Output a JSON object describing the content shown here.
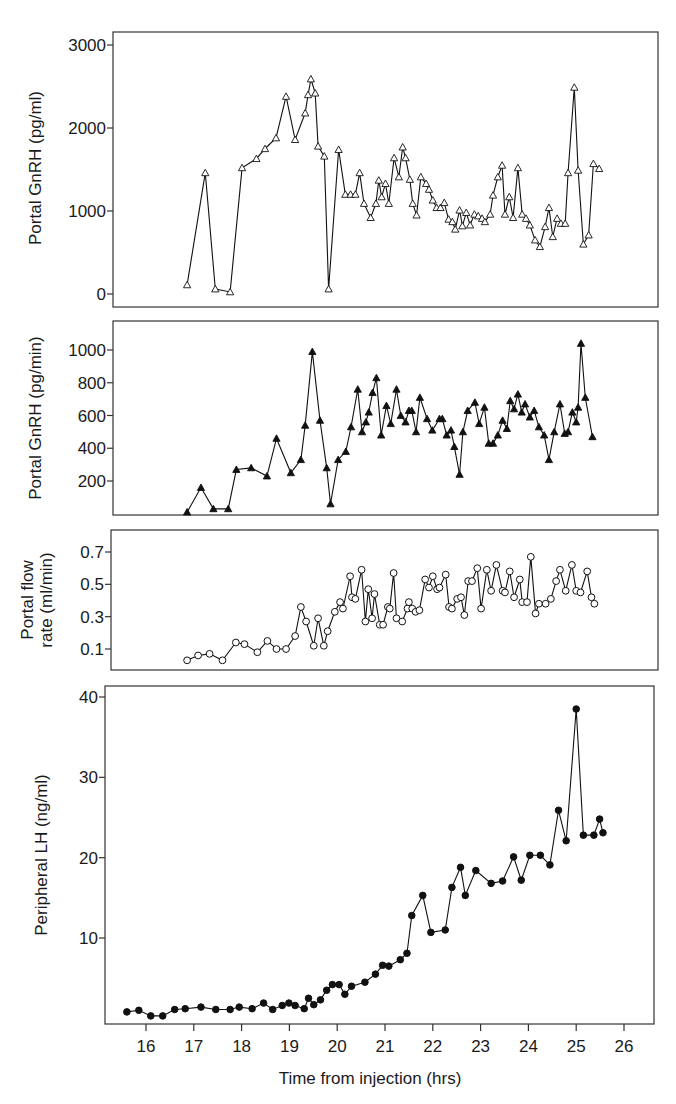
{
  "chart_data": [
    {
      "type": "line",
      "panel": 1,
      "ylabel": "Portal GnRH (pg/ml)",
      "xlabel": "",
      "marker": "open-triangle",
      "ylim": [
        -50,
        3160
      ],
      "yticks": [
        0,
        1000,
        2000,
        3000
      ],
      "ytick_labels": [
        "0",
        "1000",
        "2000",
        "3000"
      ],
      "grid": false,
      "x": [
        16.86,
        17.24,
        17.45,
        17.76,
        18.01,
        18.31,
        18.49,
        18.72,
        18.93,
        19.12,
        19.33,
        19.39,
        19.45,
        19.54,
        19.6,
        19.73,
        19.82,
        20.03,
        20.17,
        20.28,
        20.38,
        20.47,
        20.56,
        20.7,
        20.81,
        20.87,
        20.93,
        21.01,
        21.08,
        21.19,
        21.29,
        21.37,
        21.43,
        21.52,
        21.58,
        21.66,
        21.75,
        21.86,
        21.92,
        22.0,
        22.08,
        22.16,
        22.24,
        22.33,
        22.41,
        22.47,
        22.56,
        22.62,
        22.7,
        22.78,
        22.87,
        22.95,
        23.03,
        23.09,
        23.2,
        23.26,
        23.36,
        23.45,
        23.51,
        23.6,
        23.68,
        23.78,
        23.87,
        23.95,
        24.03,
        24.14,
        24.24,
        24.35,
        24.43,
        24.51,
        24.6,
        24.68,
        24.77,
        24.83,
        24.96,
        25.04,
        25.15,
        25.26,
        25.36,
        25.48
      ],
      "values": [
        110,
        1460,
        60,
        25,
        1520,
        1630,
        1750,
        1880,
        2380,
        1860,
        2180,
        2400,
        2590,
        2420,
        1780,
        1660,
        60,
        1740,
        1200,
        1200,
        1200,
        1460,
        1090,
        920,
        1090,
        1370,
        1170,
        1330,
        1090,
        1640,
        1410,
        1770,
        1640,
        1380,
        1090,
        950,
        1410,
        1330,
        1260,
        1130,
        1040,
        1040,
        1100,
        900,
        870,
        780,
        1010,
        820,
        980,
        830,
        960,
        940,
        910,
        870,
        960,
        1190,
        1410,
        1550,
        960,
        1170,
        920,
        1520,
        960,
        910,
        830,
        650,
        570,
        810,
        1040,
        690,
        910,
        850,
        850,
        1460,
        2490,
        1490,
        600,
        710,
        1570,
        1510
      ]
    },
    {
      "type": "line",
      "panel": 2,
      "ylabel": "Portal GnRH (pg/min)",
      "xlabel": "",
      "marker": "filled-triangle",
      "ylim": [
        0,
        1140
      ],
      "yticks": [
        200,
        400,
        600,
        800,
        1000
      ],
      "ytick_labels": [
        "200",
        "400",
        "600",
        "800",
        "1000"
      ],
      "grid": false,
      "x": [
        16.86,
        17.15,
        17.41,
        17.72,
        17.89,
        18.2,
        18.53,
        18.73,
        19.03,
        19.24,
        19.33,
        19.48,
        19.64,
        19.78,
        19.86,
        20.02,
        20.18,
        20.29,
        20.43,
        20.52,
        20.6,
        20.66,
        20.74,
        20.82,
        20.92,
        21.03,
        21.12,
        21.24,
        21.33,
        21.43,
        21.5,
        21.56,
        21.65,
        21.73,
        21.88,
        21.99,
        22.14,
        22.2,
        22.29,
        22.38,
        22.45,
        22.56,
        22.63,
        22.73,
        22.88,
        22.97,
        23.08,
        23.17,
        23.26,
        23.36,
        23.46,
        23.55,
        23.62,
        23.7,
        23.78,
        23.86,
        23.93,
        24.03,
        24.12,
        24.22,
        24.33,
        24.43,
        24.54,
        24.66,
        24.76,
        24.83,
        24.92,
        25.0,
        25.04,
        25.1,
        25.19,
        25.34
      ],
      "values": [
        10,
        160,
        30,
        30,
        270,
        280,
        230,
        460,
        250,
        330,
        540,
        990,
        570,
        280,
        60,
        330,
        380,
        530,
        760,
        500,
        560,
        620,
        740,
        830,
        480,
        660,
        550,
        760,
        600,
        560,
        630,
        630,
        500,
        710,
        580,
        510,
        580,
        580,
        480,
        510,
        410,
        240,
        500,
        630,
        680,
        550,
        650,
        430,
        430,
        480,
        570,
        520,
        690,
        640,
        730,
        620,
        670,
        590,
        630,
        530,
        480,
        330,
        500,
        670,
        490,
        500,
        620,
        560,
        650,
        1040,
        710,
        470,
        650
      ]
    },
    {
      "type": "line",
      "panel": 3,
      "ylabel": "Portal flow rate (ml/min)",
      "xlabel": "",
      "marker": "open-circle",
      "ylim": [
        -0.03,
        0.84
      ],
      "yticks": [
        0.1,
        0.3,
        0.5,
        0.7
      ],
      "ytick_labels": [
        "0.1",
        "0.3",
        "0.5",
        "0.7"
      ],
      "grid": false,
      "x": [
        16.86,
        17.09,
        17.33,
        17.6,
        17.88,
        18.06,
        18.33,
        18.54,
        18.73,
        18.93,
        19.12,
        19.24,
        19.35,
        19.51,
        19.6,
        19.72,
        19.8,
        19.95,
        20.06,
        20.12,
        20.27,
        20.31,
        20.38,
        20.51,
        20.59,
        20.65,
        20.73,
        20.78,
        20.89,
        20.96,
        21.06,
        21.1,
        21.18,
        21.24,
        21.36,
        21.47,
        21.5,
        21.57,
        21.64,
        21.72,
        21.84,
        21.92,
        22.0,
        22.09,
        22.14,
        22.27,
        22.34,
        22.4,
        22.51,
        22.59,
        22.66,
        22.74,
        22.82,
        22.93,
        23.01,
        23.13,
        23.22,
        23.33,
        23.46,
        23.51,
        23.61,
        23.7,
        23.82,
        23.87,
        23.97,
        24.05,
        24.15,
        24.22,
        24.36,
        24.47,
        24.58,
        24.66,
        24.78,
        24.91,
        25.0,
        25.09,
        25.23,
        25.32,
        25.38
      ],
      "values": [
        0.03,
        0.06,
        0.07,
        0.03,
        0.14,
        0.13,
        0.08,
        0.15,
        0.1,
        0.1,
        0.18,
        0.36,
        0.27,
        0.12,
        0.29,
        0.12,
        0.21,
        0.33,
        0.39,
        0.35,
        0.55,
        0.42,
        0.41,
        0.59,
        0.27,
        0.47,
        0.29,
        0.44,
        0.25,
        0.25,
        0.36,
        0.35,
        0.57,
        0.29,
        0.27,
        0.35,
        0.39,
        0.35,
        0.33,
        0.34,
        0.53,
        0.48,
        0.55,
        0.47,
        0.48,
        0.56,
        0.36,
        0.35,
        0.41,
        0.42,
        0.31,
        0.52,
        0.52,
        0.6,
        0.35,
        0.59,
        0.46,
        0.62,
        0.46,
        0.45,
        0.58,
        0.42,
        0.53,
        0.39,
        0.39,
        0.67,
        0.32,
        0.38,
        0.38,
        0.41,
        0.52,
        0.59,
        0.46,
        0.62,
        0.46,
        0.45,
        0.58,
        0.42,
        0.38
      ]
    },
    {
      "type": "line",
      "panel": 4,
      "ylabel": "Peripheral LH (ng/ml)",
      "xlabel": "Time from injection (hrs)",
      "marker": "filled-circle",
      "xlim": [
        15.1,
        26.4
      ],
      "ylim": [
        -0.3,
        41.5
      ],
      "xticks": [
        16,
        17,
        18,
        19,
        20,
        21,
        22,
        23,
        24,
        25,
        26
      ],
      "xtick_labels": [
        "16",
        "17",
        "18",
        "19",
        "20",
        "21",
        "22",
        "23",
        "24",
        "25",
        "26"
      ],
      "yticks": [
        10,
        20,
        30,
        40
      ],
      "ytick_labels": [
        "10",
        "20",
        "30",
        "40"
      ],
      "grid": false,
      "x": [
        15.6,
        15.85,
        16.1,
        16.35,
        16.6,
        16.82,
        17.15,
        17.46,
        17.76,
        17.95,
        18.22,
        18.46,
        18.65,
        18.85,
        18.99,
        19.12,
        19.31,
        19.4,
        19.51,
        19.65,
        19.78,
        19.9,
        20.04,
        20.16,
        20.3,
        20.58,
        20.8,
        20.95,
        21.08,
        21.32,
        21.46,
        21.56,
        21.79,
        21.96,
        22.26,
        22.4,
        22.58,
        22.68,
        22.9,
        23.22,
        23.46,
        23.69,
        23.85,
        24.03,
        24.25,
        24.45,
        24.63,
        24.79,
        25.0,
        25.15,
        25.37,
        25.49,
        25.56
      ],
      "values": [
        0.8,
        1.0,
        0.3,
        0.3,
        1.1,
        1.2,
        1.4,
        1.1,
        1.1,
        1.4,
        1.2,
        1.9,
        1.1,
        1.6,
        1.9,
        1.6,
        1.2,
        2.5,
        1.7,
        2.3,
        3.5,
        4.2,
        4.2,
        3.0,
        4.0,
        4.5,
        5.5,
        6.6,
        6.5,
        7.3,
        8.1,
        12.8,
        15.3,
        10.7,
        11.0,
        16.3,
        18.8,
        15.3,
        18.4,
        16.8,
        17.1,
        20.1,
        17.2,
        20.3,
        20.3,
        19.1,
        25.9,
        22.1,
        38.5,
        22.8,
        22.8,
        24.8,
        23.1
      ]
    }
  ],
  "figure": {
    "xlabel": "Time from injection (hrs)",
    "panels": [
      {
        "ylabel": "Portal GnRH (pg/ml)"
      },
      {
        "ylabel": "Portal GnRH (pg/min)"
      },
      {
        "ylabel_line1": "Portal flow",
        "ylabel_line2": "rate (ml/min)"
      },
      {
        "ylabel": "Peripheral LH (ng/ml)"
      }
    ]
  }
}
